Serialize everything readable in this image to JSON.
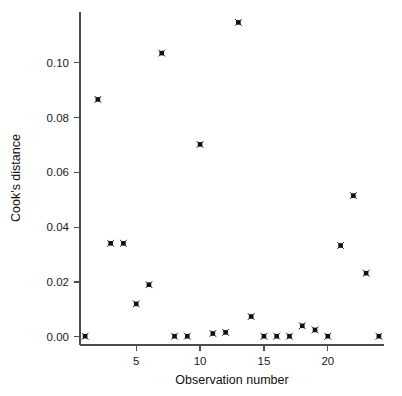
{
  "chart_data": {
    "type": "scatter",
    "title": "",
    "xlabel": "Observation number",
    "ylabel": "Cook's distance",
    "xlim": [
      0.6,
      24.4
    ],
    "ylim": [
      -0.003,
      0.1185
    ],
    "xticks": [
      5,
      10,
      15,
      20
    ],
    "xticklabels": [
      "5",
      "10",
      "15",
      "20"
    ],
    "yticks": [
      0.0,
      0.02,
      0.04,
      0.06,
      0.08,
      0.1
    ],
    "yticklabels": [
      "0.00",
      "0.02",
      "0.04",
      "0.06",
      "0.08",
      "0.10"
    ],
    "grid": false,
    "legend": null,
    "marker": "star-square",
    "marker_color": "#111111",
    "x": [
      1,
      2,
      3,
      4,
      5,
      6,
      7,
      8,
      9,
      10,
      11,
      12,
      13,
      14,
      15,
      16,
      17,
      18,
      19,
      20,
      21,
      22,
      23,
      24
    ],
    "y": [
      0.0002,
      0.0866,
      0.0341,
      0.0341,
      0.012,
      0.019,
      0.1035,
      0.0002,
      0.0002,
      0.0702,
      0.0012,
      0.0016,
      0.1147,
      0.0074,
      0.0002,
      0.0002,
      0.0002,
      0.004,
      0.0025,
      0.0002,
      0.0333,
      0.0515,
      0.0232,
      0.0002
    ],
    "series_name": "Cook's distance"
  },
  "axes": {
    "x_title": "Observation number",
    "y_title": "Cook's distance"
  }
}
